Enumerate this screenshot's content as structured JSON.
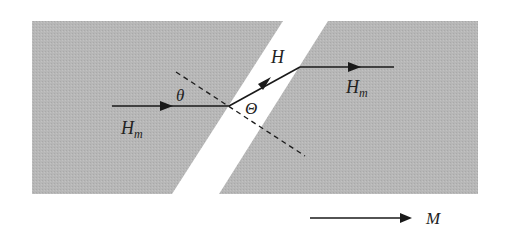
{
  "diagram": {
    "type": "magnetic field refraction across air gap",
    "colors": {
      "background": "#ffffff",
      "material": "#b4b4b4",
      "line": "#1a1a1a"
    },
    "regions": [
      {
        "name": "left-magnetic-material",
        "points": "32,21 283,21 172,194 32,194"
      },
      {
        "name": "right-magnetic-material",
        "points": "328,21 478,21 478,194 219,194"
      }
    ],
    "labels": {
      "theta": "θ",
      "Theta": "Θ",
      "H_gap": "H",
      "Hm_left_main": "H",
      "Hm_left_sub": "m",
      "Hm_right_main": "H",
      "Hm_right_sub": "m",
      "M": "M"
    }
  }
}
